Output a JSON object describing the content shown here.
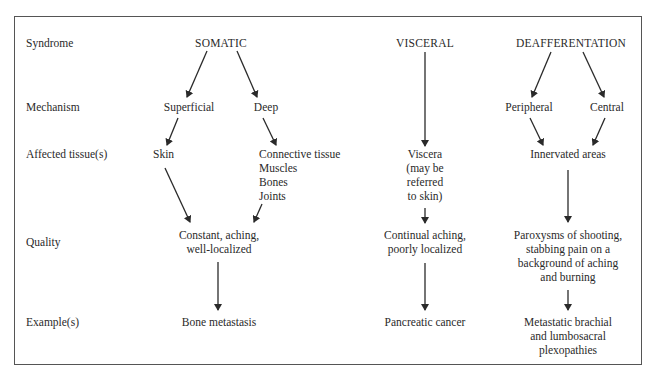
{
  "row_labels": {
    "syndrome": "Syndrome",
    "mechanism": "Mechanism",
    "affected": "Affected tissue(s)",
    "quality": "Quality",
    "example": "Example(s)"
  },
  "somatic": {
    "syndrome": "SOMATIC",
    "mechanism_superficial": "Superficial",
    "mechanism_deep": "Deep",
    "tissue_superficial": "Skin",
    "tissue_deep": [
      "Connective tissue",
      "Muscles",
      "Bones",
      "Joints"
    ],
    "quality": [
      "Constant, aching,",
      "well-localized"
    ],
    "example": "Bone metastasis"
  },
  "visceral": {
    "syndrome": "VISCERAL",
    "tissue": [
      "Viscera",
      "(may be",
      "referred",
      "to skin)"
    ],
    "quality": [
      "Continual aching,",
      "poorly localized"
    ],
    "example": "Pancreatic cancer"
  },
  "deafferentation": {
    "syndrome": "DEAFFERENTATION",
    "mechanism_peripheral": "Peripheral",
    "mechanism_central": "Central",
    "tissue": "Innervated areas",
    "quality": [
      "Paroxysms of shooting,",
      "stabbing pain on a",
      "background of aching",
      "and burning"
    ],
    "example": [
      "Metastatic brachial",
      "and lumbosacral",
      "plexopathies"
    ]
  },
  "colors": {
    "text": "#2a2a2a",
    "border": "#555555",
    "arrow": "#2a2a2a"
  }
}
